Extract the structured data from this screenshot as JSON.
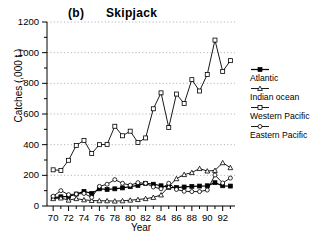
{
  "chart_data": {
    "type": "line",
    "title": "(b)      Skipjack",
    "xlabel": "Year",
    "ylabel": "Catches (,000 t )",
    "xlim": [
      69.2,
      93.6
    ],
    "ylim": [
      0,
      1200
    ],
    "ytick_values": [
      0,
      200,
      400,
      600,
      800,
      1000,
      1200
    ],
    "ytick_labels": [
      "0",
      "200",
      "400",
      "600",
      "800",
      "1000",
      "1200"
    ],
    "yminor_step": 100,
    "xtick_values": [
      70,
      72,
      74,
      76,
      78,
      80,
      82,
      84,
      86,
      88,
      90,
      92
    ],
    "xtick_labels": [
      "70",
      "72",
      "74",
      "76",
      "78",
      "80",
      "82",
      "84",
      "86",
      "88",
      "90",
      "92"
    ],
    "xminor_step": 1,
    "grid": "horizontal-dotted",
    "legend_position": "right",
    "x": [
      70,
      71,
      72,
      73,
      74,
      75,
      76,
      77,
      78,
      79,
      80,
      81,
      82,
      83,
      84,
      85,
      86,
      87,
      88,
      89,
      90,
      91,
      92,
      93
    ],
    "series": [
      {
        "name": "Atlantic",
        "marker": "filled-square",
        "values": [
          55,
          60,
          62,
          78,
          95,
          82,
          112,
          108,
          112,
          118,
          126,
          134,
          148,
          142,
          132,
          122,
          120,
          124,
          128,
          130,
          132,
          152,
          132,
          130
        ]
      },
      {
        "name": "Indian ocean",
        "marker": "open-triangle",
        "values": [
          48,
          52,
          38,
          48,
          40,
          36,
          34,
          34,
          32,
          34,
          38,
          42,
          48,
          56,
          72,
          126,
          178,
          205,
          218,
          244,
          228,
          232,
          282,
          250
        ]
      },
      {
        "name": "Western Pacific",
        "marker": "open-square",
        "values": [
          236,
          232,
          298,
          395,
          428,
          342,
          400,
          402,
          520,
          458,
          488,
          414,
          444,
          634,
          738,
          512,
          730,
          668,
          824,
          750,
          858,
          1082,
          878,
          948
        ]
      },
      {
        "name": "Eastern Pacific",
        "marker": "open-circle",
        "values": [
          64,
          100,
          74,
          78,
          82,
          56,
          128,
          142,
          172,
          148,
          136,
          152,
          148,
          124,
          112,
          148,
          108,
          96,
          94,
          94,
          104,
          202,
          150,
          182
        ]
      }
    ]
  },
  "legend": {
    "entries": [
      {
        "label": "Atlantic"
      },
      {
        "label": "Indian ocean"
      },
      {
        "label": "Western Pacific"
      },
      {
        "label": "Eastern Pacific"
      }
    ]
  }
}
